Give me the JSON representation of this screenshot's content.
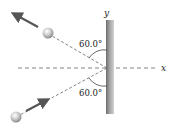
{
  "diagram": {
    "axes": {
      "x_label": "x",
      "y_label": "y"
    },
    "angles": {
      "upper": "60.0°",
      "lower": "60.0°"
    },
    "objects": [
      "incoming-ball",
      "outgoing-ball",
      "wall"
    ],
    "colors": {
      "wall": "#8a8a8a",
      "arrow": "#555555",
      "dash": "#666666"
    }
  }
}
